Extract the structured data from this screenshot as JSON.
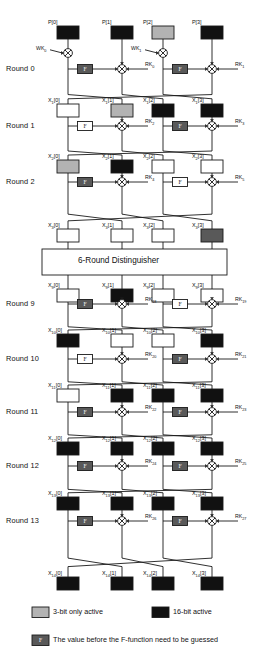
{
  "figure": {
    "branch_count": 4,
    "distinguisher_label": "6-Round Distinguisher"
  },
  "colors": {
    "black": "#111111",
    "gray_light": "#b3b3b3",
    "gray_dark": "#595959",
    "white": "#ffffff",
    "line": "#1a1a1a"
  },
  "legend": [
    {
      "swatch": "gray_light",
      "label": "3-bit only active"
    },
    {
      "swatch": "black",
      "label": "16-bit active"
    },
    {
      "swatch": "gray_dark",
      "label": "The value before the F-function need to be guessed",
      "is_f": true
    }
  ],
  "f_label": "F",
  "whitening_keys": [
    {
      "label": "WK",
      "sub": "0"
    },
    {
      "label": "WK",
      "sub": "1"
    }
  ],
  "rows": [
    {
      "row_label": "",
      "var": "P",
      "sub": "",
      "cells": [
        {
          "index": "0",
          "fill": "black"
        },
        {
          "index": "1",
          "fill": "black"
        },
        {
          "index": "2",
          "fill": "gray_light"
        },
        {
          "index": "3",
          "fill": "black"
        }
      ]
    },
    {
      "var": "X",
      "sub": "1",
      "cells": [
        {
          "index": "0",
          "fill": "white"
        },
        {
          "index": "1",
          "fill": "gray_light"
        },
        {
          "index": "2",
          "fill": "black"
        },
        {
          "index": "3",
          "fill": "black"
        }
      ]
    },
    {
      "var": "X",
      "sub": "2",
      "cells": [
        {
          "index": "0",
          "fill": "gray_light"
        },
        {
          "index": "1",
          "fill": "black"
        },
        {
          "index": "2",
          "fill": "white"
        },
        {
          "index": "3",
          "fill": "white"
        }
      ]
    },
    {
      "var": "X",
      "sub": "3",
      "cells": [
        {
          "index": "0",
          "fill": "white"
        },
        {
          "index": "1",
          "fill": "white"
        },
        {
          "index": "2",
          "fill": "white"
        },
        {
          "index": "3",
          "fill": "gray_dark"
        }
      ]
    },
    {
      "var": "X",
      "sub": "9",
      "cells": [
        {
          "index": "0",
          "fill": "white"
        },
        {
          "index": "1",
          "fill": "black"
        },
        {
          "index": "2",
          "fill": "white"
        },
        {
          "index": "3",
          "fill": "white"
        }
      ]
    },
    {
      "var": "X",
      "sub": "10",
      "cells": [
        {
          "index": "0",
          "fill": "black"
        },
        {
          "index": "1",
          "fill": "white"
        },
        {
          "index": "2",
          "fill": "white"
        },
        {
          "index": "3",
          "fill": "black"
        }
      ]
    },
    {
      "var": "X",
      "sub": "11",
      "cells": [
        {
          "index": "0",
          "fill": "white"
        },
        {
          "index": "1",
          "fill": "black"
        },
        {
          "index": "2",
          "fill": "black"
        },
        {
          "index": "3",
          "fill": "black"
        }
      ]
    },
    {
      "var": "X",
      "sub": "12",
      "cells": [
        {
          "index": "0",
          "fill": "black"
        },
        {
          "index": "1",
          "fill": "black"
        },
        {
          "index": "2",
          "fill": "black"
        },
        {
          "index": "3",
          "fill": "black"
        }
      ]
    },
    {
      "var": "X",
      "sub": "13",
      "cells": [
        {
          "index": "0",
          "fill": "black"
        },
        {
          "index": "1",
          "fill": "black"
        },
        {
          "index": "2",
          "fill": "black"
        },
        {
          "index": "3",
          "fill": "black"
        }
      ]
    },
    {
      "var": "X",
      "sub": "14",
      "cells": [
        {
          "index": "0",
          "fill": "black"
        },
        {
          "index": "1",
          "fill": "black"
        },
        {
          "index": "2",
          "fill": "black"
        },
        {
          "index": "3",
          "fill": "black"
        }
      ]
    }
  ],
  "rounds": [
    {
      "label": "Round 0",
      "has_whitening": true,
      "f_left": "gray_dark",
      "f_right": "gray_dark",
      "rk_left": {
        "label": "RK",
        "sub": "0"
      },
      "rk_right": {
        "label": "RK",
        "sub": "1"
      }
    },
    {
      "label": "Round 1",
      "has_whitening": false,
      "f_left": "white",
      "f_right": "gray_dark",
      "rk_left": {
        "label": "RK",
        "sub": "2"
      },
      "rk_right": {
        "label": "RK",
        "sub": "3"
      }
    },
    {
      "label": "Round 2",
      "has_whitening": false,
      "f_left": "gray_dark",
      "f_right": "white",
      "rk_left": {
        "label": "RK",
        "sub": "4"
      },
      "rk_right": {
        "label": "RK",
        "sub": "5"
      }
    },
    {
      "label": "Round 9",
      "has_whitening": false,
      "f_left": "gray_dark",
      "f_right": "white",
      "rk_left": {
        "label": "RK",
        "sub": "18"
      },
      "rk_right": {
        "label": "RK",
        "sub": "19"
      }
    },
    {
      "label": "Round 10",
      "has_whitening": false,
      "f_left": "white",
      "f_right": "gray_dark",
      "rk_left": {
        "label": "RK",
        "sub": "20"
      },
      "rk_right": {
        "label": "RK",
        "sub": "21"
      }
    },
    {
      "label": "Round 11",
      "has_whitening": false,
      "f_left": "gray_dark",
      "f_right": "gray_dark",
      "rk_left": {
        "label": "RK",
        "sub": "22"
      },
      "rk_right": {
        "label": "RK",
        "sub": "23"
      }
    },
    {
      "label": "Round 12",
      "has_whitening": false,
      "f_left": "gray_dark",
      "f_right": "gray_dark",
      "rk_left": {
        "label": "RK",
        "sub": "24"
      },
      "rk_right": {
        "label": "RK",
        "sub": "25"
      }
    },
    {
      "label": "Round 13",
      "has_whitening": false,
      "f_left": "gray_dark",
      "f_right": "gray_dark",
      "rk_left": {
        "label": "RK",
        "sub": "26"
      },
      "rk_right": {
        "label": "RK",
        "sub": "27"
      }
    }
  ]
}
